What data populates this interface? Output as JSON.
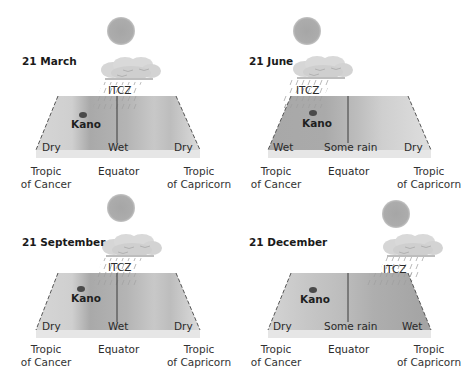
{
  "panels": [
    {
      "date": "21 March",
      "itcz_label": "ITCZ",
      "city_label": "Kano",
      "zones": {
        "left": "Dry",
        "center": "Wet",
        "right": "Dry"
      },
      "bottom_labels": {
        "left_line1": "Tropic",
        "left_line2": "of Cancer",
        "center": "Equator",
        "right_line1": "Tropic",
        "right_line2": "of Capricorn"
      }
    },
    {
      "date": "21 June",
      "itcz_label": "ITCZ",
      "city_label": "Kano",
      "zones": {
        "left": "Wet",
        "center": "Some rain",
        "right": "Dry"
      },
      "bottom_labels": {
        "left_line1": "Tropic",
        "left_line2": "of Cancer",
        "center": "Equator",
        "right_line1": "Tropic",
        "right_line2": "of Capricorn"
      }
    },
    {
      "date": "21 September",
      "itcz_label": "ITCZ",
      "city_label": "Kano",
      "zones": {
        "left": "Dry",
        "center": "Wet",
        "right": "Dry"
      },
      "bottom_labels": {
        "left_line1": "Tropic",
        "left_line2": "of Cancer",
        "center": "Equator",
        "right_line1": "Tropic",
        "right_line2": "of Capricorn"
      }
    },
    {
      "date": "21 December",
      "itcz_label": "ITCZ",
      "city_label": "Kano",
      "zones": {
        "left": "Dry",
        "center": "Some rain",
        "right": "Wet"
      },
      "bottom_labels": {
        "left_line1": "Tropic",
        "left_line2": "of Cancer",
        "center": "Equator",
        "right_line1": "Tropic",
        "right_line2": "of Capricorn"
      }
    }
  ],
  "colors": {
    "sun": "#a9a9a9",
    "cloud": "#d4d4d4",
    "surface_dark": "#a6a6a6",
    "surface_light": "#dadada",
    "slab": "#e8e8e8",
    "edge": "#555555"
  }
}
